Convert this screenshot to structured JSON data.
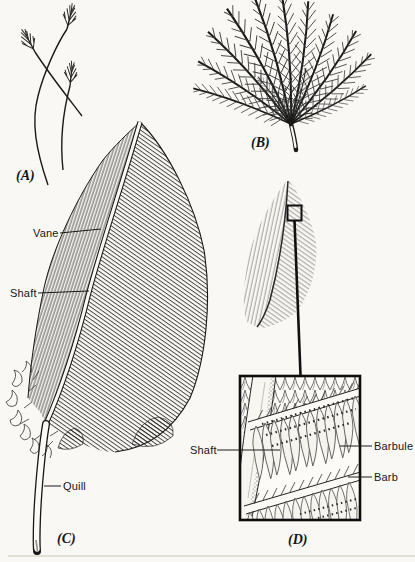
{
  "figure": {
    "background_color": "#f9f8f4",
    "ink_color": "#1a1a1a",
    "panel_labels": {
      "a": "(A)",
      "b": "(B)",
      "c": "(C)",
      "d": "(D)"
    },
    "annotations": {
      "vane": "Vane",
      "shaft_feather": "Shaft",
      "quill": "Quill",
      "shaft_detail": "Shaft",
      "barbule": "Barbule",
      "barb": "Barb"
    }
  }
}
